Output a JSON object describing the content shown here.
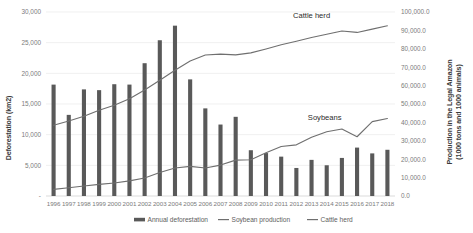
{
  "chart_data": {
    "type": "bar",
    "title": "",
    "subtitle": "",
    "xlabel": "",
    "ylabel": "Deforestation (km2)",
    "y2label": "Production in the Legal Amazon (1000 tons and 1000 animals)",
    "grid": true,
    "legend_position": "bottom",
    "categories": [
      "1996",
      "1997",
      "1998",
      "1999",
      "2000",
      "2001",
      "2002",
      "2003",
      "2004",
      "2005",
      "2006",
      "2007",
      "2008",
      "2009",
      "2010",
      "2011",
      "2012",
      "2013",
      "2014",
      "2015",
      "2016",
      "2017",
      "2018"
    ],
    "ylim": [
      0,
      30000
    ],
    "yticks": [
      0,
      5000,
      10000,
      15000,
      20000,
      25000,
      30000
    ],
    "ytick_labels": [
      "-",
      "5,000",
      "10,000",
      "15,000",
      "20,000",
      "25,000",
      "30,000"
    ],
    "y2lim": [
      0,
      100000
    ],
    "y2ticks": [
      0,
      10000,
      20000,
      30000,
      40000,
      50000,
      60000,
      70000,
      80000,
      90000,
      100000
    ],
    "y2tick_labels": [
      "0.0",
      "10,000.0",
      "20,000.0",
      "30,000.0",
      "40,000.0",
      "50,000.0",
      "60,000.0",
      "70,000.0",
      "80,000.0",
      "90,000.0",
      "100,000.0"
    ],
    "series": [
      {
        "name": "Annual deforestation",
        "type": "bar",
        "axis": "left",
        "color": "#595959",
        "values": [
          18161,
          13227,
          17383,
          17259,
          18226,
          18165,
          21651,
          25396,
          27772,
          19014,
          14286,
          11651,
          12911,
          7464,
          7000,
          6418,
          4571,
          5891,
          5012,
          6207,
          7893,
          6947,
          7536
        ]
      },
      {
        "name": "Soybean production",
        "type": "line",
        "axis": "right",
        "color": "#6f6f6f",
        "values": [
          3600,
          4500,
          5400,
          6300,
          7100,
          8200,
          9800,
          12800,
          15200,
          16100,
          15200,
          16800,
          19500,
          19700,
          23500,
          26900,
          27800,
          31900,
          34900,
          36400,
          32200,
          40400,
          42100
        ]
      },
      {
        "name": "Cattle herd",
        "type": "line",
        "axis": "right",
        "color": "#6f6f6f",
        "values": [
          38500,
          40800,
          43300,
          46600,
          49300,
          52800,
          57600,
          62900,
          68300,
          73400,
          76600,
          77100,
          76700,
          77800,
          79900,
          82200,
          84100,
          86100,
          87900,
          89700,
          88900,
          90700,
          92500
        ]
      }
    ],
    "annotations": [
      {
        "text": "Cattle herd",
        "x": 2013,
        "value": 90700
      },
      {
        "text": "Soybeans",
        "x": 2014,
        "value": 34900
      }
    ],
    "legend": [
      {
        "label": "Annual deforestation",
        "marker": "bar",
        "color": "#595959"
      },
      {
        "label": "Soybean production",
        "marker": "line",
        "color": "#6f6f6f"
      },
      {
        "label": "Cattle herd",
        "marker": "line",
        "color": "#6f6f6f"
      }
    ]
  }
}
